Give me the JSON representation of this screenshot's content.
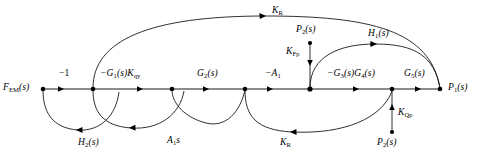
{
  "figure": {
    "type": "signal-flow-graph",
    "width": 481,
    "height": 163,
    "background": "#ffffff",
    "ink_color": "#1a1a1a"
  },
  "nodes": [
    {
      "id": "n1",
      "label": "F_EM(s)",
      "x": 43,
      "y": 89,
      "label_pos": "left"
    },
    {
      "id": "n2",
      "label": "",
      "x": 93,
      "y": 89,
      "label_pos": "none"
    },
    {
      "id": "n3",
      "label": "",
      "x": 172,
      "y": 89,
      "label_pos": "none"
    },
    {
      "id": "n4",
      "label": "",
      "x": 245,
      "y": 89,
      "label_pos": "none"
    },
    {
      "id": "n5",
      "label": "",
      "x": 310,
      "y": 89,
      "label_pos": "none"
    },
    {
      "id": "n6",
      "label": "",
      "x": 392,
      "y": 89,
      "label_pos": "none"
    },
    {
      "id": "n7",
      "label": "P_1(s)",
      "x": 440,
      "y": 89,
      "label_pos": "right"
    },
    {
      "id": "src_p2_top",
      "label": "P_2(s)",
      "x": 310,
      "y": 43,
      "label_pos": "above"
    },
    {
      "id": "src_p2_bot",
      "label": "P_2(s)",
      "x": 392,
      "y": 132,
      "label_pos": "below"
    }
  ],
  "edges": [
    {
      "id": "e1",
      "from": "n1",
      "to": "n2",
      "gain": "-1",
      "path": "forward-main"
    },
    {
      "id": "e2",
      "from": "n2",
      "to": "n3",
      "gain": "-G1(s)Kqy",
      "path": "forward-main"
    },
    {
      "id": "e3",
      "from": "n3",
      "to": "n4",
      "gain": "G2(s)",
      "path": "forward-main"
    },
    {
      "id": "e4",
      "from": "n4",
      "to": "n5",
      "gain": "-A1",
      "path": "forward-main"
    },
    {
      "id": "e5",
      "from": "n5",
      "to": "n6",
      "gain": "-G3(s)G4(s)",
      "path": "forward-main"
    },
    {
      "id": "e6",
      "from": "n6",
      "to": "n7",
      "gain": "G5(s)",
      "path": "forward-main"
    },
    {
      "id": "e7",
      "from": "n2",
      "to": "n7",
      "gain": "KR",
      "path": "arc-above-long"
    },
    {
      "id": "e8",
      "from": "n5",
      "to": "n7",
      "gain": "H1(s)",
      "path": "arc-above-short"
    },
    {
      "id": "e9",
      "from": "src_p2_top",
      "to": "n5",
      "gain": "KFp",
      "path": "vertical-down"
    },
    {
      "id": "e10",
      "from": "src_p2_bot",
      "to": "n6",
      "gain": "KQp",
      "path": "vertical-up"
    },
    {
      "id": "e11",
      "from": "n2",
      "to": "n1",
      "gain": "H2(s)",
      "path": "arc-below"
    },
    {
      "id": "e12",
      "from": "n3",
      "to": "n2",
      "gain": "A1s",
      "path": "arc-below"
    },
    {
      "id": "e13",
      "from": "n4",
      "to": "n3",
      "gain": "KR",
      "path": "arc-below"
    },
    {
      "id": "e14",
      "from": "n6",
      "to": "n4",
      "gain": "KR",
      "path": "arc-below-long"
    }
  ],
  "labels": {
    "f_em": {
      "base": "F",
      "sub": "EM",
      "tail": "(s)",
      "x": 3,
      "y": 83
    },
    "minus_one": {
      "text": "−1",
      "x": 59,
      "y": 70
    },
    "g1kqy": {
      "base": "−G",
      "sub": "1",
      "tail": "(s)K",
      "sub2": "qy",
      "x": 100,
      "y": 70
    },
    "g2": {
      "base": "G",
      "sub": "2",
      "tail": "(s)",
      "x": 197,
      "y": 70
    },
    "minus_a1": {
      "base": "−A",
      "sub": "1",
      "tail": "",
      "x": 265,
      "y": 70
    },
    "g3g4": {
      "base": "−G",
      "sub": "3",
      "tail": "(s)G",
      "sub2": "4",
      "tail2": "(s)",
      "x": 327,
      "y": 70
    },
    "g5": {
      "base": "G",
      "sub": "5",
      "tail": "(s)",
      "x": 404,
      "y": 70
    },
    "p1": {
      "base": "P",
      "sub": "1",
      "tail": "(s)",
      "x": 448,
      "y": 83
    },
    "kr_top": {
      "base": "K",
      "sub": "R",
      "tail": "",
      "x": 272,
      "y": 8
    },
    "p2_top": {
      "base": "P",
      "sub": "2",
      "tail": "(s)",
      "x": 296,
      "y": 26
    },
    "kfp": {
      "base": "K",
      "sub": "Fp",
      "tail": "",
      "x": 288,
      "y": 48
    },
    "h1": {
      "base": "H",
      "sub": "1",
      "tail": "(s)",
      "x": 368,
      "y": 31
    },
    "kqp": {
      "base": "K",
      "sub": "Qp",
      "tail": "",
      "x": 399,
      "y": 110
    },
    "p2_bot": {
      "base": "P",
      "sub": "2",
      "tail": "(s)",
      "x": 378,
      "y": 140
    },
    "h2": {
      "base": "H",
      "sub": "2",
      "tail": "(s)",
      "x": 78,
      "y": 140
    },
    "a1s": {
      "base": "A",
      "sub": "1",
      "tail": "s",
      "x": 167,
      "y": 138
    },
    "kr_bot": {
      "base": "K",
      "sub": "R",
      "tail": "",
      "x": 280,
      "y": 140
    }
  }
}
